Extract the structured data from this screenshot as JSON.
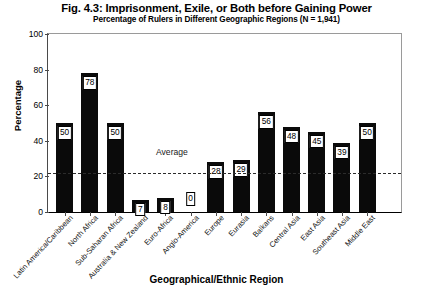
{
  "chart_data": {
    "type": "bar",
    "title": "Fig. 4.3: Imprisonment, Exile, or Both before Gaining Power",
    "subtitle": "Percentage of Rulers in Different Geographic Regions (N = 1,941)",
    "xlabel": "Geographical/Ethnic Region",
    "ylabel": "Percentage",
    "ylim": [
      0,
      100
    ],
    "yticks": [
      0,
      20,
      40,
      60,
      80,
      100
    ],
    "grid": false,
    "legend": null,
    "bar_color": "#0a0a0a",
    "label_box_color": "#ffffff",
    "categories": [
      "Latin America/Caribbean",
      "North Africa",
      "Sub-Saharan Africa",
      "Australia & New Zealand",
      "Euro-Africa",
      "Anglo-America",
      "Europe",
      "Eurasia",
      "Balkans",
      "Central Asia",
      "East Asia",
      "Southeast Asia",
      "Middle East"
    ],
    "values": [
      50,
      78,
      50,
      7,
      8,
      0,
      28,
      29,
      56,
      48,
      45,
      39,
      50
    ],
    "annotations": [
      {
        "name": "average-line",
        "label": "Average",
        "value": 22,
        "style": "dashed"
      }
    ]
  }
}
